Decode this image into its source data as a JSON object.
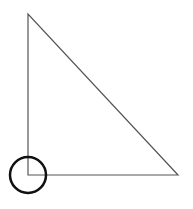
{
  "diagram": {
    "type": "right-triangle",
    "vertices": {
      "top": [
        28,
        14
      ],
      "right_angle": [
        28,
        175
      ],
      "bottom_right": [
        178,
        175
      ]
    },
    "right_angle_marker": {
      "shape": "circle",
      "center": [
        28,
        175
      ],
      "radius": 18
    },
    "colors": {
      "triangle_stroke": "#555555",
      "circle_stroke": "#111111",
      "background": "#ffffff"
    }
  }
}
